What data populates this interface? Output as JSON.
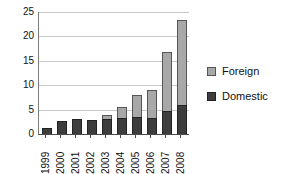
{
  "chart_data": {
    "type": "bar",
    "stacked": true,
    "title": "",
    "subtitle": "",
    "xlabel": "",
    "ylabel": "",
    "categories": [
      "1999",
      "2000",
      "2001",
      "2002",
      "2003",
      "2004",
      "2005",
      "2006",
      "2007",
      "2008"
    ],
    "series": [
      {
        "name": "Domestic",
        "color": "#3d3d3d",
        "values": [
          1.2,
          2.7,
          3.1,
          2.8,
          3.0,
          3.3,
          3.4,
          3.3,
          4.8,
          6.0
        ]
      },
      {
        "name": "Foreign",
        "color": "#a8a8a8",
        "values": [
          0.0,
          0.0,
          0.0,
          0.0,
          1.0,
          2.3,
          4.6,
          5.7,
          12.1,
          17.3
        ]
      }
    ],
    "totals": [
      1.2,
      2.7,
      3.1,
      2.8,
      4.0,
      5.6,
      8.0,
      9.0,
      16.9,
      23.3
    ],
    "ylim": [
      0,
      25
    ],
    "yticks": [
      0,
      5,
      10,
      15,
      20,
      25
    ],
    "ytick_labels": [
      "0",
      "5",
      "10",
      "15",
      "20",
      "25"
    ],
    "grid": "horizontal",
    "legend_position": "right",
    "legend_entries": [
      {
        "label": "Foreign",
        "swatch": "foreign-swatch-icon"
      },
      {
        "label": "Domestic",
        "swatch": "domestic-swatch-icon"
      }
    ]
  }
}
